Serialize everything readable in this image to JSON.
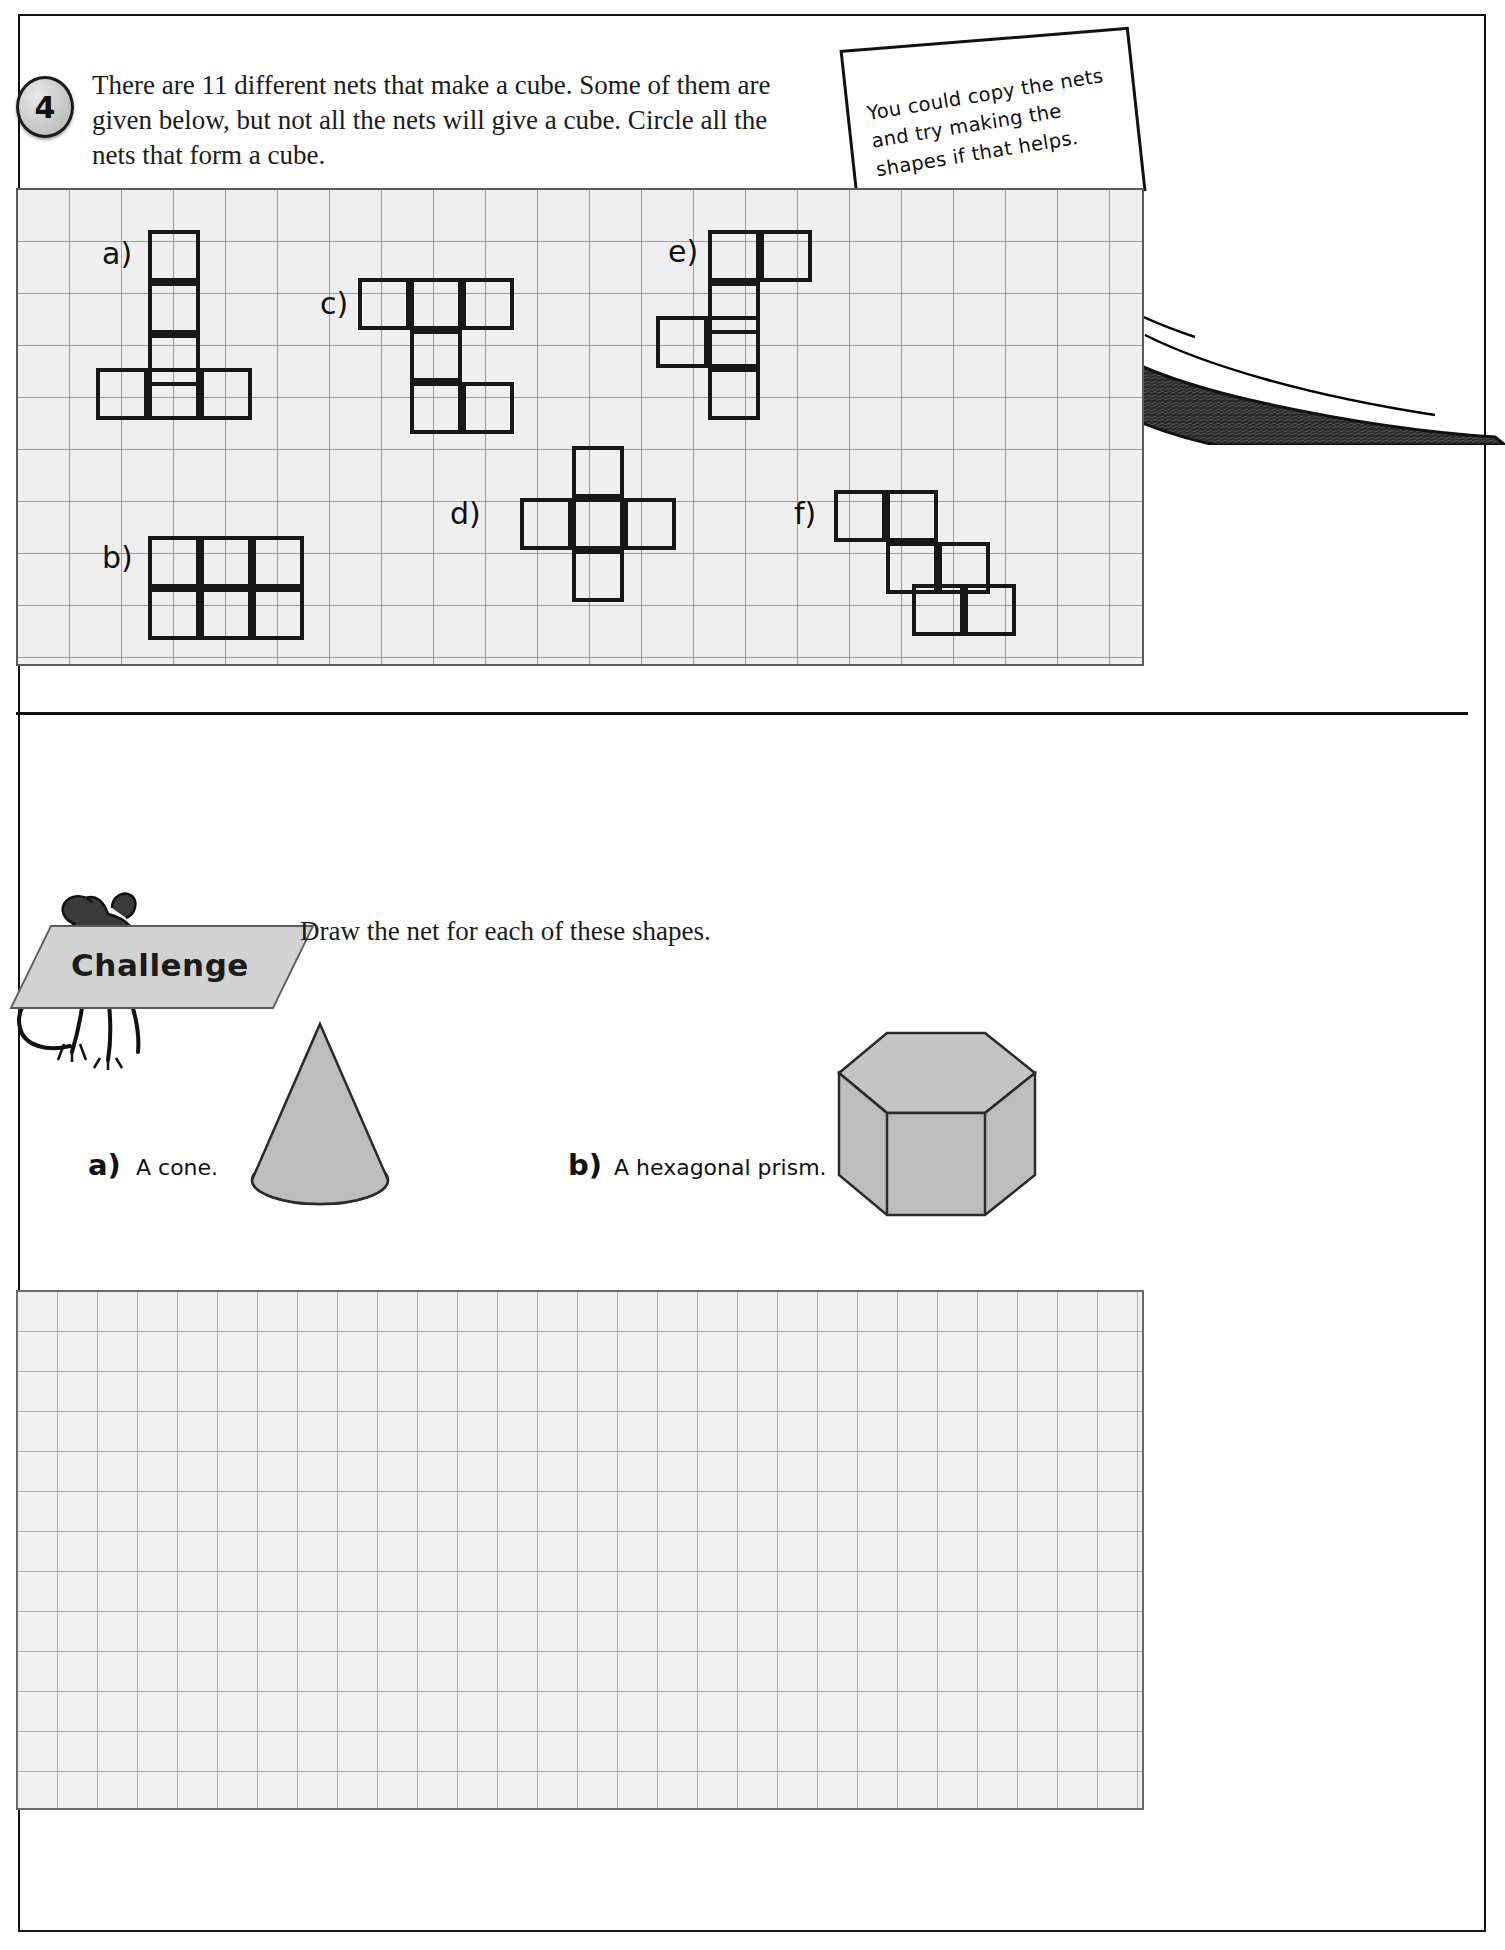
{
  "page": {
    "question_number": "4",
    "question_text": "There are 11 different nets that make a cube. Some of them are given below, but not all the nets will give a cube. Circle all the nets that form a cube.",
    "hint_note": "You could copy the nets and try making the shapes if that helps.",
    "hint_lines": [
      "You could copy the nets",
      "and try making the",
      "shapes if that helps."
    ]
  },
  "nets": {
    "labels": [
      {
        "key": "a",
        "text": "a)"
      },
      {
        "key": "b",
        "text": "b)"
      },
      {
        "key": "c",
        "text": "c)"
      },
      {
        "key": "d",
        "text": "d)"
      },
      {
        "key": "e",
        "text": "e)"
      },
      {
        "key": "f",
        "text": "f)"
      }
    ],
    "grid_cell_px": 52,
    "shapes": {
      "a": {
        "cells": [
          [
            2,
            1
          ],
          [
            2,
            2
          ],
          [
            2,
            3
          ],
          [
            1,
            4
          ],
          [
            2,
            4
          ],
          [
            3,
            4
          ]
        ]
      },
      "b": {
        "cells": [
          [
            3,
            7
          ],
          [
            4,
            7
          ],
          [
            5,
            7
          ],
          [
            3,
            8
          ],
          [
            4,
            8
          ],
          [
            5,
            8
          ]
        ]
      },
      "c": {
        "cells": [
          [
            7,
            2
          ],
          [
            8,
            2
          ],
          [
            9,
            2
          ],
          [
            8,
            3
          ],
          [
            8,
            4
          ],
          [
            9,
            4
          ]
        ]
      },
      "d": {
        "cells": [
          [
            11,
            5
          ],
          [
            10,
            6
          ],
          [
            11,
            6
          ],
          [
            12,
            6
          ],
          [
            13,
            6
          ],
          [
            11,
            7
          ]
        ]
      },
      "e": {
        "cells": [
          [
            14,
            1
          ],
          [
            15,
            1
          ],
          [
            14,
            2
          ],
          [
            13,
            3
          ],
          [
            14,
            3
          ],
          [
            14,
            4
          ]
        ]
      },
      "f": {
        "cells": [
          [
            17,
            6
          ],
          [
            18,
            6
          ],
          [
            18,
            7
          ],
          [
            19,
            7
          ],
          [
            18,
            8
          ],
          [
            19,
            8
          ]
        ]
      }
    }
  },
  "challenge": {
    "badge_label": "Challenge",
    "instruction": "Draw the net for each of these shapes.",
    "items": [
      {
        "label": "a)",
        "text": "A cone.",
        "shape": "cone"
      },
      {
        "label": "b)",
        "text": "A hexagonal prism.",
        "shape": "hexagonal-prism"
      }
    ]
  },
  "colors": {
    "ink": "#171717",
    "grid_line": "#5a5a5a",
    "grid_fill": "#efefef",
    "shape_fill": "#b9b9b9",
    "badge_fill": "#d2d2d2"
  }
}
